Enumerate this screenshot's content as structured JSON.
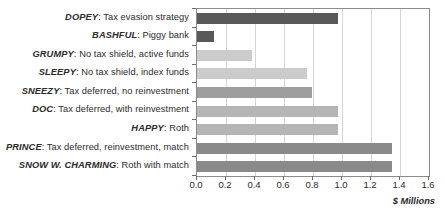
{
  "chart_data": {
    "type": "bar",
    "orientation": "horizontal",
    "title": "",
    "xlabel": "$ Millions",
    "ylabel": "",
    "xlim": [
      0.0,
      1.6
    ],
    "xticks": [
      "0.0",
      "0.2",
      "0.4",
      "0.6",
      "0.8",
      "1.0",
      "1.2",
      "1.4",
      "1.6"
    ],
    "xtick_values": [
      0.0,
      0.2,
      0.4,
      0.6,
      0.8,
      1.0,
      1.2,
      1.4,
      1.6
    ],
    "grid": "vertical",
    "legend": "none",
    "categories": [
      "DOPEY: Tax evasion strategy",
      "BASHFUL: Piggy bank",
      "GRUMPY: No tax shield, active funds",
      "SLEEPY: No tax shield, index funds",
      "SNEEZY: Tax deferred, no reinvestment",
      "DOC: Tax deferred, with reinvestment",
      "HAPPY: Roth",
      "PRINCE: Tax deferred, reinvestment, match",
      "SNOW W. CHARMING: Roth with match"
    ],
    "values": [
      0.97,
      0.115,
      0.38,
      0.76,
      0.79,
      0.97,
      0.97,
      1.345,
      1.345
    ],
    "bars": [
      {
        "name": "DOPEY",
        "desc": ": Tax evasion strategy",
        "value": 0.97,
        "color": "#595959"
      },
      {
        "name": "BASHFUL",
        "desc": ": Piggy bank",
        "value": 0.115,
        "color": "#595959"
      },
      {
        "name": "GRUMPY",
        "desc": ": No tax shield, active funds",
        "value": 0.38,
        "color": "#cbcbcb"
      },
      {
        "name": "SLEEPY",
        "desc": ": No tax shield, index funds",
        "value": 0.76,
        "color": "#cbcbcb"
      },
      {
        "name": "SNEEZY",
        "desc": ": Tax deferred, no reinvestment",
        "value": 0.79,
        "color": "#9e9e9e"
      },
      {
        "name": "DOC",
        "desc": ": Tax deferred, with reinvestment",
        "value": 0.97,
        "color": "#b5b5b5"
      },
      {
        "name": "HAPPY",
        "desc": ": Roth",
        "value": 0.97,
        "color": "#b5b5b5"
      },
      {
        "name": "PRINCE",
        "desc": ": Tax deferred, reinvestment, match",
        "value": 1.345,
        "color": "#8a8a8a"
      },
      {
        "name": "SNOW W. CHARMING",
        "desc": ": Roth with match",
        "value": 1.345,
        "color": "#8a8a8a"
      }
    ],
    "colors": {
      "axis": "#8c8c8c",
      "grid": "#d4d4d4",
      "text": "#2b2b2b",
      "background": "#ffffff"
    }
  }
}
